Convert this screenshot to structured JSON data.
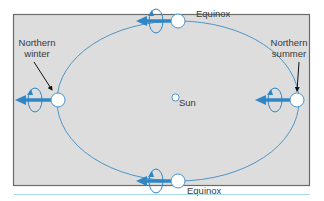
{
  "diagram": {
    "labels": {
      "equinox_top": "Equinox",
      "equinox_bottom": "Equinox",
      "sun": "Sun",
      "northern_winter_line1": "Northern",
      "northern_winter_line2": "winter",
      "northern_summer_line1": "Northern",
      "northern_summer_line2": "summer"
    },
    "colors": {
      "panel_background": "#dcdddc",
      "panel_border": "#6b6b6b",
      "orbit": "#3f8cc4",
      "spin_arrow": "#2f86c6",
      "planet_fill": "#ffffff",
      "planet_stroke": "#4a93c9",
      "pointer_arrow": "#111111",
      "bottom_rule": "#a9dbe9"
    }
  }
}
